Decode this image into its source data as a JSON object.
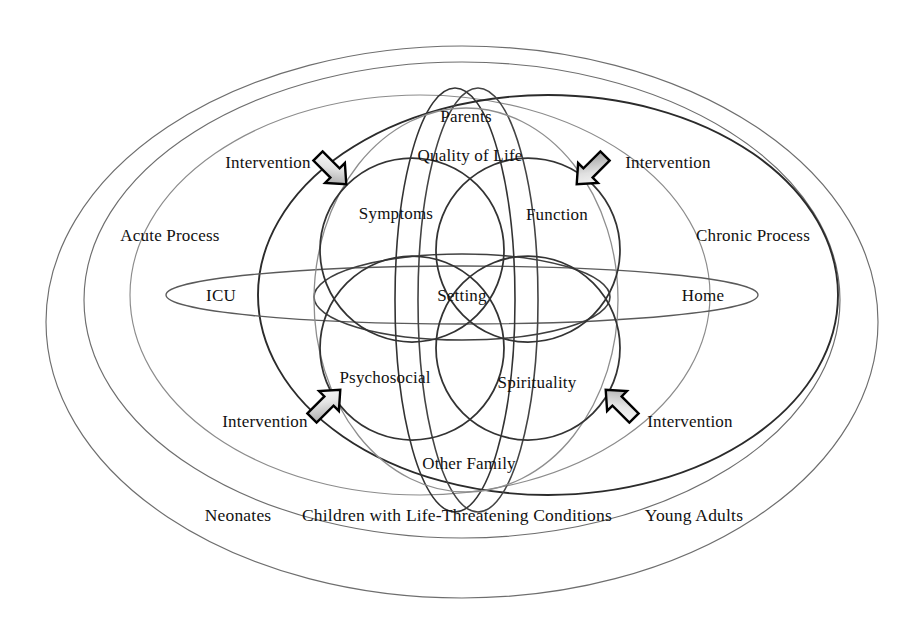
{
  "figure": {
    "title": "Model of palliative care for children with life-threatening conditions",
    "type": "venn-ellipse-diagram",
    "background_color": "#ffffff",
    "ink_color": "#111111"
  },
  "outer_rings": [
    {
      "name": "outermost-boundary",
      "stroke": "#6e6e6e",
      "stroke_width": 1.1
    },
    {
      "name": "population-boundary",
      "stroke": "#6e6e6e",
      "stroke_width": 1.1
    }
  ],
  "process_labels": {
    "acute": "Acute Process",
    "chronic": "Chronic Process"
  },
  "setting_labels": {
    "left": "ICU",
    "center": "Setting",
    "right": "Home"
  },
  "domain_labels": {
    "top_center_outer": "Parents",
    "top_center_inner": "Quality of Life",
    "upper_left": "Symptoms",
    "upper_right": "Function",
    "lower_left": "Psychosocial",
    "lower_right": "Spirituality",
    "bottom_center": "Other Family"
  },
  "interventions": [
    {
      "id": "intervention-top-left",
      "label": "Intervention",
      "direction": "down-right",
      "x": 213,
      "y": 163
    },
    {
      "id": "intervention-top-right",
      "label": "Intervention",
      "direction": "down-left",
      "x": 613,
      "y": 163
    },
    {
      "id": "intervention-bottom-left",
      "label": "Intervention",
      "direction": "up-right",
      "x": 211,
      "y": 424
    },
    {
      "id": "intervention-bottom-right",
      "label": "Intervention",
      "direction": "up-left",
      "x": 649,
      "y": 424
    }
  ],
  "bottom_caption": {
    "left": "Neonates",
    "center": "Children with Life-Threatening Conditions",
    "right": "Young Adults"
  },
  "colors": {
    "light_ring": "#6e6e6e",
    "mid_ring": "#555555",
    "dark_ring": "#2b2b2b",
    "arrow_outline": "#000000",
    "arrow_fill_light": "#f0f0f0",
    "arrow_fill_dark": "#8a8a8a"
  }
}
